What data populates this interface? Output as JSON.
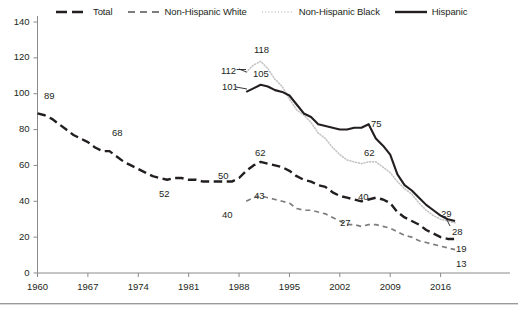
{
  "legend": {
    "items": [
      {
        "label": "Total",
        "style": "long-dash",
        "color": "#231f20",
        "icon": "legend-line-total"
      },
      {
        "label": "Non-Hispanic White",
        "style": "dash",
        "color": "#7d7d7d",
        "icon": "legend-line-white"
      },
      {
        "label": "Non-Hispanic Black",
        "style": "dotted",
        "color": "#c4c4c4",
        "icon": "legend-line-black"
      },
      {
        "label": "Hispanic",
        "style": "solid",
        "color": "#231f20",
        "icon": "legend-line-hispanic"
      }
    ]
  },
  "chart_data": {
    "type": "line",
    "title": "",
    "subtitle": "",
    "xlabel": "",
    "ylabel": "",
    "xlim": [
      1960,
      2018
    ],
    "ylim": [
      0,
      140
    ],
    "yticks": [
      0,
      20,
      40,
      60,
      80,
      100,
      120,
      140
    ],
    "xticks": [
      1960,
      1967,
      1974,
      1981,
      1988,
      1995,
      2002,
      2009,
      2016
    ],
    "grid": false,
    "legend_position": "top",
    "series": [
      {
        "name": "Total",
        "style": "long-dash",
        "color": "#231f20",
        "x": [
          1960,
          1961,
          1962,
          1963,
          1964,
          1965,
          1966,
          1967,
          1968,
          1969,
          1970,
          1971,
          1972,
          1973,
          1974,
          1975,
          1976,
          1977,
          1978,
          1979,
          1980,
          1981,
          1982,
          1983,
          1984,
          1985,
          1986,
          1987,
          1988,
          1989,
          1990,
          1991,
          1992,
          1993,
          1994,
          1995,
          1996,
          1997,
          1998,
          1999,
          2000,
          2001,
          2002,
          2003,
          2004,
          2005,
          2006,
          2007,
          2008,
          2009,
          2010,
          2011,
          2012,
          2013,
          2014,
          2015,
          2016,
          2017,
          2018
        ],
        "y": [
          89,
          88,
          86,
          83,
          80,
          77,
          75,
          73,
          70,
          68,
          68,
          65,
          62,
          60,
          58,
          56,
          54,
          53,
          52,
          53,
          53,
          52,
          52,
          51,
          51,
          51,
          51,
          51,
          53,
          57,
          60,
          62,
          61,
          60,
          59,
          57,
          54,
          52,
          51,
          49,
          48,
          45,
          43,
          42,
          41,
          40,
          41,
          42,
          41,
          39,
          34,
          31,
          29,
          27,
          24,
          22,
          20,
          19,
          19
        ]
      },
      {
        "name": "Non-Hispanic White",
        "style": "dash",
        "color": "#7d7d7d",
        "x": [
          1989,
          1990,
          1991,
          1992,
          1993,
          1994,
          1995,
          1996,
          1997,
          1998,
          1999,
          2000,
          2001,
          2002,
          2003,
          2004,
          2005,
          2006,
          2007,
          2008,
          2009,
          2010,
          2011,
          2012,
          2013,
          2014,
          2015,
          2016,
          2017,
          2018
        ],
        "y": [
          40,
          42,
          43,
          42,
          41,
          40,
          39,
          36,
          35,
          35,
          34,
          33,
          31,
          29,
          27,
          27,
          26,
          27,
          27,
          26,
          25,
          23,
          21,
          20,
          18,
          17,
          16,
          15,
          14,
          13
        ]
      },
      {
        "name": "Non-Hispanic Black",
        "style": "dotted",
        "color": "#c4c4c4",
        "x": [
          1989,
          1990,
          1991,
          1992,
          1993,
          1994,
          1995,
          1996,
          1997,
          1998,
          1999,
          2000,
          2001,
          2002,
          2003,
          2004,
          2005,
          2006,
          2007,
          2008,
          2009,
          2010,
          2011,
          2012,
          2013,
          2014,
          2015,
          2016,
          2017,
          2018
        ],
        "y": [
          112,
          116,
          118,
          114,
          108,
          104,
          97,
          91,
          88,
          84,
          78,
          75,
          70,
          66,
          63,
          62,
          61,
          62,
          62,
          59,
          56,
          51,
          47,
          44,
          39,
          35,
          32,
          30,
          29,
          28
        ]
      },
      {
        "name": "Hispanic",
        "style": "solid",
        "color": "#231f20",
        "x": [
          1989,
          1990,
          1991,
          1992,
          1993,
          1994,
          1995,
          1996,
          1997,
          1998,
          1999,
          2000,
          2001,
          2002,
          2003,
          2004,
          2005,
          2006,
          2007,
          2008,
          2009,
          2010,
          2011,
          2012,
          2013,
          2014,
          2015,
          2016,
          2017,
          2018
        ],
        "y": [
          101,
          103,
          105,
          104,
          102,
          101,
          99,
          94,
          89,
          87,
          83,
          82,
          81,
          80,
          80,
          81,
          81,
          83,
          75,
          71,
          66,
          55,
          49,
          46,
          42,
          38,
          35,
          32,
          30,
          29
        ]
      }
    ],
    "point_labels": [
      {
        "text": "89",
        "series": "Total",
        "x": 1960,
        "y": 89,
        "px": 44,
        "py": 90
      },
      {
        "text": "68",
        "series": "Total",
        "x": 1969,
        "y": 68,
        "px": 112,
        "py": 127
      },
      {
        "text": "52",
        "series": "Total",
        "x": 1978,
        "y": 52,
        "px": 159,
        "py": 188
      },
      {
        "text": "50",
        "series": "Total",
        "x": 1988,
        "y": 50,
        "px": 218,
        "py": 170
      },
      {
        "text": "62",
        "series": "Total",
        "x": 1991,
        "y": 62,
        "px": 255,
        "py": 147
      },
      {
        "text": "40",
        "series": "Non-Hispanic White",
        "x": 1989,
        "y": 40,
        "px": 222,
        "py": 209
      },
      {
        "text": "43",
        "series": "Non-Hispanic White",
        "x": 1991,
        "y": 43,
        "px": 254,
        "py": 190
      },
      {
        "text": "101",
        "series": "Hispanic",
        "x": 1989,
        "y": 101,
        "px": 222,
        "py": 81
      },
      {
        "text": "105",
        "series": "Hispanic",
        "x": 1991,
        "y": 105,
        "px": 253,
        "py": 68
      },
      {
        "text": "112",
        "series": "Non-Hispanic Black",
        "x": 1989,
        "y": 112,
        "px": 221,
        "py": 65
      },
      {
        "text": "118",
        "series": "Non-Hispanic Black",
        "x": 1991,
        "y": 118,
        "px": 254,
        "py": 44
      },
      {
        "text": "75",
        "series": "Hispanic",
        "x": 2007,
        "y": 75,
        "px": 371,
        "py": 118
      },
      {
        "text": "62",
        "series": "Non-Hispanic Black",
        "x": 2007,
        "y": 62,
        "px": 364,
        "py": 147
      },
      {
        "text": "40",
        "series": "Total",
        "x": 2006,
        "y": 41,
        "px": 358,
        "py": 191
      },
      {
        "text": "27",
        "series": "Non-Hispanic White",
        "x": 2005,
        "y": 27,
        "px": 340,
        "py": 217
      },
      {
        "text": "29",
        "series": "Hispanic",
        "x": 2018,
        "y": 29,
        "px": 441,
        "py": 208
      },
      {
        "text": "28",
        "series": "Non-Hispanic Black",
        "x": 2018,
        "y": 28,
        "px": 452,
        "py": 226
      },
      {
        "text": "19",
        "series": "Total",
        "x": 2018,
        "y": 19,
        "px": 456,
        "py": 243
      },
      {
        "text": "13",
        "series": "Non-Hispanic White",
        "x": 2018,
        "y": 13,
        "px": 456,
        "py": 258
      }
    ]
  },
  "axes": {
    "y_tick_labels": [
      "140",
      "120",
      "100",
      "80",
      "60",
      "40",
      "20",
      "0"
    ],
    "x_tick_labels": [
      "1960",
      "1967",
      "1974",
      "1981",
      "1988",
      "1995",
      "2002",
      "2009",
      "2016"
    ]
  }
}
